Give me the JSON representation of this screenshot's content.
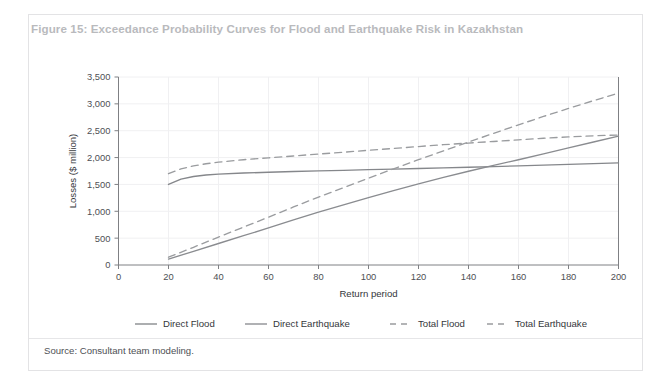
{
  "figure": {
    "title": "Figure 15: Exceedance Probability Curves for Flood and Earthquake Risk in Kazakhstan",
    "source": "Source: Consultant team modeling.",
    "title_color": "#b9babd",
    "border_color": "#e3e3e5"
  },
  "chart_data": {
    "type": "line",
    "title": "Figure 15: Exceedance Probability Curves for Flood and Earthquake Risk in Kazakhstan",
    "xlabel": "Return period",
    "ylabel": "Losses ($ million)",
    "xlim": [
      0,
      200
    ],
    "ylim": [
      0,
      3500
    ],
    "xticks": [
      0,
      20,
      40,
      60,
      80,
      100,
      120,
      140,
      160,
      180,
      200
    ],
    "xtick_labels": [
      "0",
      "20",
      "40",
      "60",
      "80",
      "100",
      "120",
      "140",
      "160",
      "180",
      "200"
    ],
    "yticks": [
      0,
      500,
      1000,
      1500,
      2000,
      2500,
      3000,
      3500
    ],
    "ytick_labels": [
      "0",
      "500",
      "1,000",
      "1,500",
      "2,000",
      "2,500",
      "3,000",
      "3,500"
    ],
    "grid": true,
    "legend_position": "bottom",
    "series": [
      {
        "name": "Direct Flood",
        "style": "solid",
        "color": "#85878b",
        "x": [
          20,
          25,
          30,
          35,
          40,
          50,
          60,
          70,
          80,
          90,
          100,
          110,
          120,
          130,
          140,
          150,
          160,
          170,
          180,
          190,
          200
        ],
        "values": [
          1500,
          1600,
          1648,
          1675,
          1692,
          1712,
          1726,
          1740,
          1752,
          1763,
          1775,
          1786,
          1797,
          1808,
          1820,
          1832,
          1845,
          1858,
          1872,
          1886,
          1900
        ]
      },
      {
        "name": "Direct Earthquake",
        "style": "solid",
        "color": "#8a8c90",
        "x": [
          20,
          30,
          40,
          50,
          60,
          70,
          80,
          90,
          100,
          110,
          120,
          130,
          140,
          150,
          160,
          170,
          180,
          190,
          200
        ],
        "values": [
          110,
          255,
          400,
          545,
          690,
          840,
          985,
          1120,
          1255,
          1385,
          1510,
          1630,
          1745,
          1855,
          1960,
          2070,
          2180,
          2290,
          2400
        ]
      },
      {
        "name": "Total Flood",
        "style": "dashed",
        "color": "#9a9c9f",
        "x": [
          20,
          25,
          30,
          35,
          40,
          50,
          60,
          70,
          80,
          90,
          100,
          110,
          120,
          130,
          140,
          150,
          160,
          170,
          180,
          190,
          200
        ],
        "values": [
          1700,
          1790,
          1845,
          1885,
          1915,
          1960,
          1995,
          2030,
          2065,
          2100,
          2135,
          2170,
          2205,
          2240,
          2270,
          2300,
          2330,
          2360,
          2385,
          2405,
          2420
        ]
      },
      {
        "name": "Total Earthquake",
        "style": "dashed",
        "color": "#9a9c9f",
        "x": [
          20,
          30,
          40,
          50,
          60,
          70,
          80,
          90,
          100,
          110,
          120,
          130,
          140,
          150,
          160,
          170,
          180,
          190,
          200
        ],
        "values": [
          145,
          330,
          520,
          705,
          890,
          1080,
          1265,
          1440,
          1615,
          1790,
          1960,
          2125,
          2290,
          2450,
          2610,
          2765,
          2915,
          3060,
          3200
        ]
      }
    ]
  }
}
